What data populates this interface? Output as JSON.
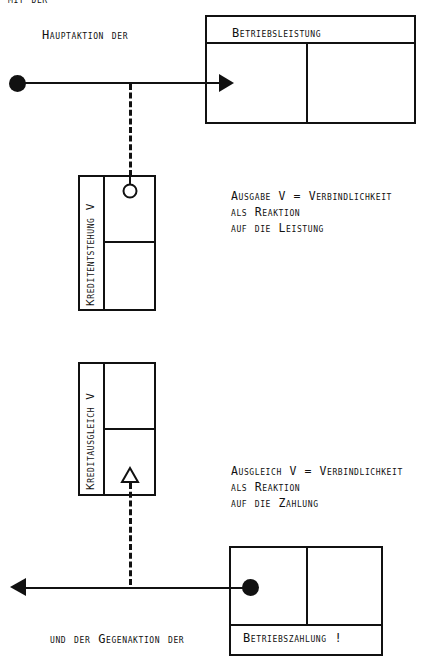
{
  "header_fragment": "mit der",
  "top_flow": {
    "label": "Hauptaktion der",
    "target_box_title": "Betriebsleistung"
  },
  "account_credit_creation": {
    "label": "Kreditentstehung V",
    "marker": "circle-icon"
  },
  "annotation_top": {
    "lines": [
      "Ausgabe V = Verbindlichkeit",
      "als Reaktion",
      "auf die Leistung"
    ]
  },
  "account_credit_settlement": {
    "label": "Kreditausgleich V",
    "marker": "triangle-icon"
  },
  "annotation_bottom": {
    "lines": [
      "Ausgleich V = Verbindlichkeit",
      "als Reaktion",
      "auf die Zahlung"
    ]
  },
  "bottom_flow": {
    "label": "und der Gegenaktion der",
    "source_box_title": "Betriebszahlung !"
  },
  "colors": {
    "ink": "#111111",
    "background": "#ffffff"
  }
}
